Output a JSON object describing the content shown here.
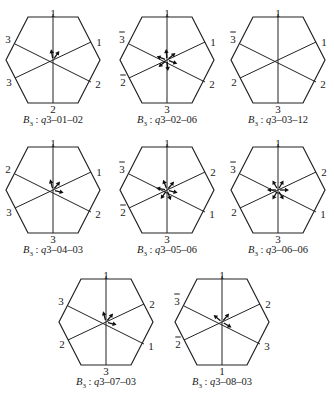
{
  "figure": {
    "panels": [
      {
        "id": "q3-01-02",
        "caption_prefix": "B",
        "caption_sub": "3",
        "caption_q": "q",
        "caption_rest": "3–01–02",
        "cx": 53,
        "cy": 60,
        "labels": {
          "top": "1",
          "top_bar": false,
          "bottom": "2",
          "bottom_bar": false,
          "ul": "3",
          "ul_bar": false,
          "ll": "3",
          "ll_bar": false,
          "ur": "1",
          "ur_bar": false,
          "lr": "2",
          "lr_bar": false
        },
        "arrows": [
          -100,
          -55
        ]
      },
      {
        "id": "q3-02-06",
        "caption_prefix": "B",
        "caption_sub": "3",
        "caption_q": "q",
        "caption_rest": "3–02–06",
        "cx": 167,
        "cy": 60,
        "labels": {
          "top": "1",
          "top_bar": false,
          "bottom": "3",
          "bottom_bar": false,
          "ul": "3",
          "ul_bar": true,
          "ll": "2",
          "ll_bar": true,
          "ur": "1",
          "ur_bar": false,
          "lr": "2",
          "lr_bar": false
        },
        "arrows": [
          -95,
          -40,
          20,
          85,
          140,
          -160
        ]
      },
      {
        "id": "q3-03-12",
        "caption_prefix": "B",
        "caption_sub": "3",
        "caption_q": "q",
        "caption_rest": "3–03–12",
        "cx": 278,
        "cy": 60,
        "labels": {
          "top": "1",
          "top_bar": false,
          "bottom": "3",
          "bottom_bar": false,
          "ul": "3",
          "ul_bar": true,
          "ll": "2",
          "ll_bar": false,
          "ur": "1",
          "ur_bar": false,
          "lr": "2",
          "lr_bar": false
        },
        "arrows": []
      },
      {
        "id": "q3-04-03",
        "caption_prefix": "B",
        "caption_sub": "3",
        "caption_q": "q",
        "caption_rest": "3–04–03",
        "cx": 53,
        "cy": 190,
        "labels": {
          "top": "1",
          "top_bar": false,
          "bottom": "3",
          "bottom_bar": false,
          "ul": "2",
          "ul_bar": false,
          "ll": "3",
          "ll_bar": false,
          "ur": "1",
          "ur_bar": false,
          "lr": "2",
          "lr_bar": false
        },
        "arrows": [
          -105,
          -50,
          15
        ]
      },
      {
        "id": "q3-05-06",
        "caption_prefix": "B",
        "caption_sub": "3",
        "caption_q": "q",
        "caption_rest": "3–05–06",
        "cx": 167,
        "cy": 190,
        "labels": {
          "top": "1",
          "top_bar": false,
          "bottom": "3",
          "bottom_bar": false,
          "ul": "3",
          "ul_bar": true,
          "ll": "2",
          "ll_bar": true,
          "ur": "2",
          "ur_bar": false,
          "lr": "1",
          "lr_bar": false
        },
        "arrows": [
          -110,
          -50,
          15,
          70,
          125,
          -170
        ]
      },
      {
        "id": "q3-06-06",
        "caption_prefix": "B",
        "caption_sub": "3",
        "caption_q": "q",
        "caption_rest": "3–06–06",
        "cx": 278,
        "cy": 190,
        "labels": {
          "top": "1",
          "top_bar": false,
          "bottom": "3",
          "bottom_bar": false,
          "ul": "3",
          "ul_bar": true,
          "ll": "2",
          "ll_bar": false,
          "ur": "2",
          "ur_bar": false,
          "lr": "1",
          "lr_bar": false
        },
        "arrows": [
          -120,
          -60,
          0,
          60,
          120,
          180
        ]
      },
      {
        "id": "q3-07-03",
        "caption_prefix": "B",
        "caption_sub": "3",
        "caption_q": "q",
        "caption_rest": "3–07–03",
        "cx": 106,
        "cy": 322,
        "labels": {
          "top": "1",
          "top_bar": false,
          "bottom": "3",
          "bottom_bar": false,
          "ul": "3",
          "ul_bar": false,
          "ll": "2",
          "ll_bar": false,
          "ur": "2",
          "ur_bar": false,
          "lr": "1",
          "lr_bar": false
        },
        "arrows": [
          -105,
          -50,
          15
        ]
      },
      {
        "id": "q3-08-03",
        "caption_prefix": "B",
        "caption_sub": "3",
        "caption_q": "q",
        "caption_rest": "3–08–03",
        "cx": 222,
        "cy": 322,
        "labels": {
          "top": "1",
          "top_bar": false,
          "bottom": "1",
          "bottom_bar": false,
          "ul": "3",
          "ul_bar": true,
          "ll": "2",
          "ll_bar": true,
          "ur": "2",
          "ur_bar": false,
          "lr": "3",
          "lr_bar": false
        },
        "arrows": [
          -140,
          -50,
          30
        ]
      }
    ],
    "colors": {
      "line": "#222222",
      "background": "#ffffff"
    }
  }
}
